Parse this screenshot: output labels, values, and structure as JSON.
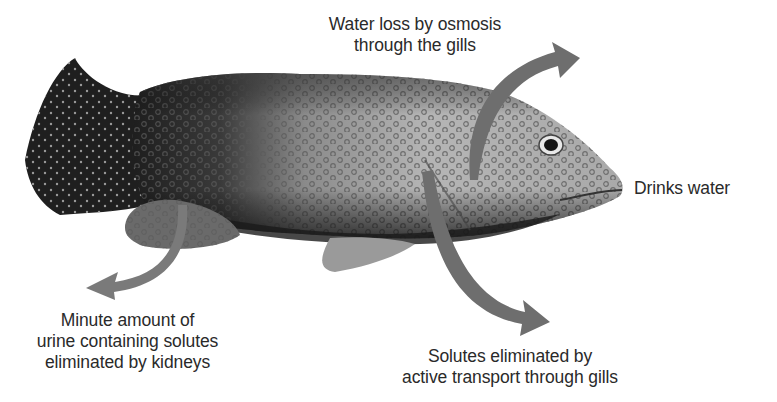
{
  "figure": {
    "image": "spotted-grouper-fish",
    "arrow_color": "#6e6e6e"
  },
  "labels": {
    "water_loss": {
      "line1": "Water loss by osmosis",
      "line2": "through the gills"
    },
    "drinks": {
      "text": "Drinks water"
    },
    "urine": {
      "line1": "Minute amount of",
      "line2": "urine containing solutes",
      "line3": "eliminated by kidneys"
    },
    "solutes": {
      "line1": "Solutes eliminated by",
      "line2": "active transport through gills"
    }
  }
}
